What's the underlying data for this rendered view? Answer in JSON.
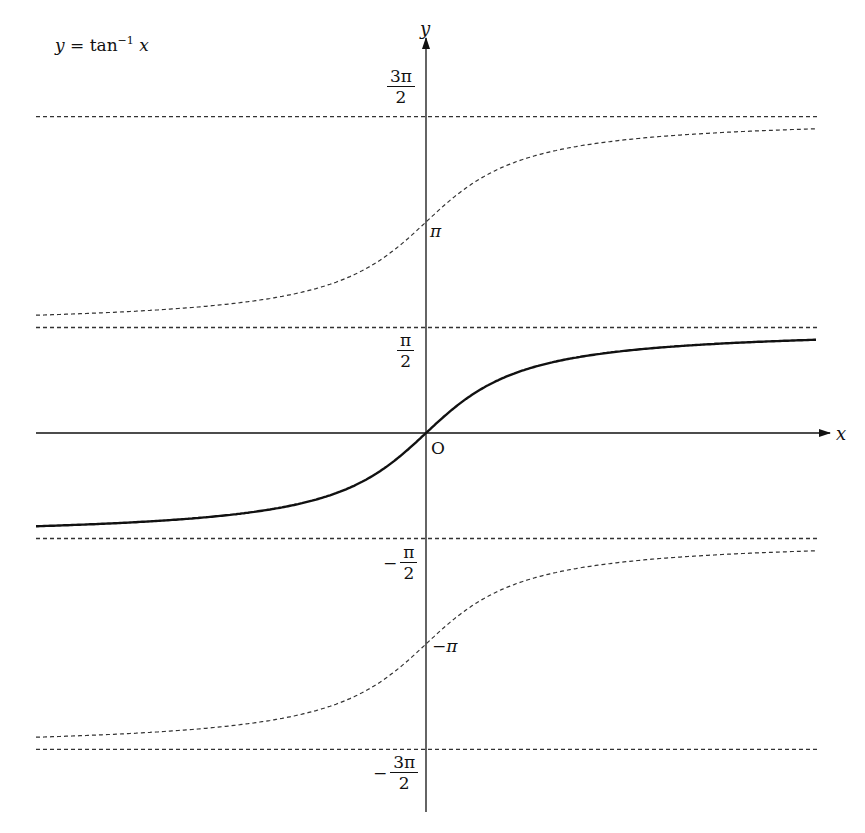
{
  "chart_data": {
    "type": "line",
    "title_parts": {
      "lhs": "y",
      "eq": " = tan",
      "sup": "−1",
      "arg": " x"
    },
    "xlabel": "x",
    "ylabel": "y",
    "origin_label": "O",
    "grid": false,
    "legend": "none",
    "xlim": [
      -5.4,
      5.4
    ],
    "ylim": [
      -4.9,
      6.0
    ],
    "y_ticks": [
      {
        "value": 4.712,
        "sign": "",
        "num": "3π",
        "den": "2"
      },
      {
        "value": 3.1416,
        "text": "π"
      },
      {
        "value": 1.5708,
        "sign": "",
        "num": "π",
        "den": "2"
      },
      {
        "value": -1.5708,
        "sign": "−",
        "num": "π",
        "den": "2"
      },
      {
        "value": -3.1416,
        "text": "−π"
      },
      {
        "value": -4.712,
        "sign": "−",
        "num": "3π",
        "den": "2"
      }
    ],
    "asymptotes": [
      {
        "y": 4.712,
        "style": "dashed"
      },
      {
        "y": 1.5708,
        "style": "dashed"
      },
      {
        "y": -1.5708,
        "style": "dashed"
      },
      {
        "y": -4.712,
        "style": "dashed"
      }
    ],
    "series": [
      {
        "name": "principal branch y = tan^-1 x",
        "offset": 0,
        "style": "solid",
        "x_range": [
          -5.4,
          5.4
        ]
      },
      {
        "name": "branch shifted +π",
        "offset": 3.1416,
        "style": "dashed",
        "x_range": [
          -5.4,
          5.4
        ]
      },
      {
        "name": "branch shifted −π",
        "offset": -3.1416,
        "style": "dashed",
        "x_range": [
          -5.4,
          5.4
        ]
      }
    ],
    "sample_points": {
      "x": [
        -5,
        -3,
        -2,
        -1,
        -0.5,
        0,
        0.5,
        1,
        2,
        3,
        5
      ],
      "principal_y": [
        -1.373,
        -1.249,
        -1.107,
        -0.785,
        -0.464,
        0,
        0.464,
        0.785,
        1.107,
        1.249,
        1.373
      ]
    }
  },
  "colors": {
    "axis": "#111111",
    "curve": "#111111",
    "dashed": "#333333",
    "background": "#ffffff"
  }
}
